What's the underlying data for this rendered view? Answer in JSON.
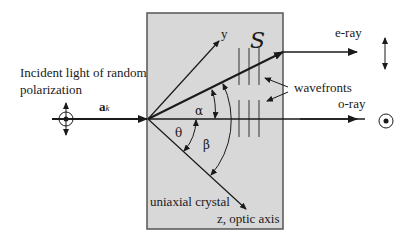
{
  "diagram": {
    "type": "birefringence",
    "crystal": {
      "label": "uniaxial crystal",
      "fill": "#d8d8d8",
      "border": "#555555",
      "x": 147,
      "y": 13,
      "width": 136,
      "height": 216
    },
    "incident": {
      "label_line1": "Incident light of random",
      "label_line2": "polarization",
      "vector_label": "a",
      "vector_subscript": "k"
    },
    "axes": {
      "y_label": "y",
      "z_label": "z, optic axis"
    },
    "rays": {
      "e_ray": "e-ray",
      "o_ray": "o-ray"
    },
    "poynting_symbol": "S",
    "wavefronts_label": "wavefronts",
    "angles": {
      "alpha": "α",
      "beta": "β",
      "theta": "θ"
    },
    "colors": {
      "line": "#1a1a1a",
      "crystal": "#d8d8d8",
      "background": "#ffffff"
    }
  }
}
